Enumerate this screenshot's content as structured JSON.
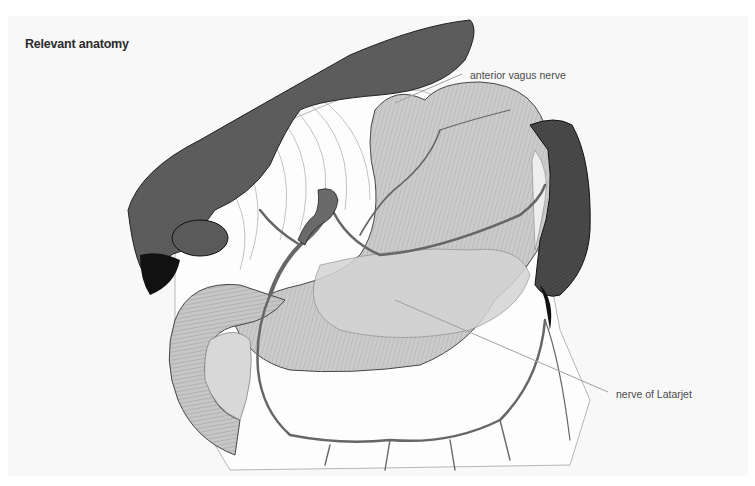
{
  "figure": {
    "title": "Relevant anatomy",
    "labels": [
      {
        "id": "anterior-vagus-nerve",
        "text": "anterior vagus nerve"
      },
      {
        "id": "nerve-of-latarjet",
        "text": "nerve of Latarjet"
      }
    ],
    "structures": [
      "liver",
      "gallbladder",
      "stomach",
      "duodenum",
      "pancreas",
      "spleen",
      "blood-vessels",
      "omentum"
    ],
    "colors": {
      "liver": "#5e5e5e",
      "stomach": "#c8c8c8",
      "vessels": "#6a6a6a",
      "spleen": "#3c3c3c",
      "leader_line": "#a0a0a0",
      "background": "#f8f8f8"
    }
  }
}
